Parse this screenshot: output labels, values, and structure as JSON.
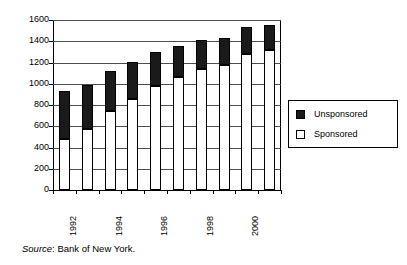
{
  "chart_data": {
    "type": "bar",
    "subtype": "stacked-column",
    "title": "",
    "subtitle": "",
    "xlabel": "",
    "ylabel": "",
    "ylim": [
      0,
      1600
    ],
    "ytick_step": 200,
    "ytick_labels": [
      "0",
      "200",
      "400",
      "600",
      "800",
      "1000",
      "1200",
      "1400",
      "1600"
    ],
    "ytick_values": [
      0,
      200,
      400,
      600,
      800,
      1000,
      1200,
      1400,
      1600
    ],
    "grid": true,
    "grid_axis": "y",
    "legend_position": "right",
    "categories": [
      "1992",
      "1993",
      "1994",
      "1995",
      "1996",
      "1997",
      "1998",
      "1999",
      "2000",
      "2001"
    ],
    "xtick_labels_shown": [
      "1992",
      "1994",
      "1996",
      "1998",
      "2000"
    ],
    "xtick_label_rotation": -90,
    "series": [
      {
        "name": "Sponsored",
        "color": "#ffffff",
        "border": "#000000",
        "values": [
          480,
          570,
          740,
          860,
          980,
          1060,
          1135,
          1175,
          1280,
          1315
        ]
      },
      {
        "name": "Unsponsored",
        "color": "#1a1a1a",
        "border": "#000000",
        "values": [
          450,
          420,
          380,
          345,
          320,
          300,
          280,
          260,
          250,
          240
        ]
      }
    ],
    "totals": [
      930,
      990,
      1120,
      1205,
      1300,
      1360,
      1415,
      1435,
      1530,
      1555
    ],
    "stack_order": [
      "Sponsored",
      "Unsponsored"
    ]
  },
  "legend": {
    "items": [
      {
        "label": "Unsponsored",
        "swatch": "filled"
      },
      {
        "label": "Sponsored",
        "swatch": "hollow"
      }
    ]
  },
  "caption": {
    "prefix": "Source",
    "separator": ": ",
    "text": "Bank of New York."
  },
  "colors": {
    "unsponsored": "#1a1a1a",
    "sponsored": "#ffffff",
    "axis": "#000000",
    "grid": "#4d4d4d",
    "background": "#ffffff"
  }
}
